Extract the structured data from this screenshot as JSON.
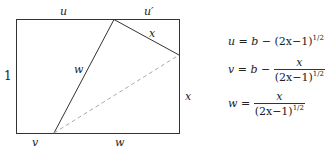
{
  "diagram": {
    "labels": {
      "top_left": "u",
      "top_right": "u′",
      "fold_top_edge": "x",
      "left_side": "1",
      "fold_long": "w",
      "right_side": "x",
      "bottom_left": "v",
      "bottom_right": "w"
    },
    "equations": [
      {
        "lhs": "u",
        "rhs_a": "b",
        "minus": "−",
        "expr": "(2x−1)",
        "exp": "1/2"
      },
      {
        "lhs": "v",
        "rhs_a": "b",
        "minus": "−",
        "num": "x",
        "den": "(2x−1)",
        "exp": "1/2"
      },
      {
        "lhs": "w",
        "num": "x",
        "den": "(2x−1)",
        "exp": "1/2"
      }
    ],
    "colors": {
      "line": "#333333",
      "dashed": "#aaaaaa"
    }
  }
}
